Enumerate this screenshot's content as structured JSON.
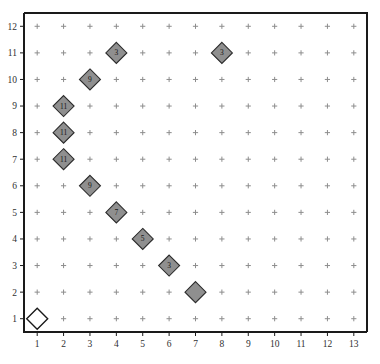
{
  "chart_data": {
    "type": "scatter",
    "title": "",
    "subtitle": "",
    "xlabel": "",
    "ylabel": "",
    "xlim": [
      1,
      13
    ],
    "ylim": [
      1,
      12
    ],
    "grid": true,
    "grid_marker": "+",
    "legend": "none",
    "x_ticks": [
      "1",
      "2",
      "3",
      "4",
      "5",
      "6",
      "7",
      "8",
      "9",
      "10",
      "11",
      "12",
      "13"
    ],
    "y_ticks": [
      "1",
      "2",
      "3",
      "4",
      "5",
      "6",
      "7",
      "8",
      "9",
      "10",
      "11",
      "12"
    ],
    "marker_shape": "diamond",
    "points": [
      {
        "x": 1,
        "y": 1,
        "label": "",
        "style": "open"
      },
      {
        "x": 2,
        "y": 9,
        "label": "11",
        "style": "filled"
      },
      {
        "x": 2,
        "y": 8,
        "label": "11",
        "style": "filled"
      },
      {
        "x": 2,
        "y": 7,
        "label": "11",
        "style": "filled"
      },
      {
        "x": 3,
        "y": 10,
        "label": "9",
        "style": "filled"
      },
      {
        "x": 3,
        "y": 6,
        "label": "9",
        "style": "filled"
      },
      {
        "x": 4,
        "y": 11,
        "label": "3",
        "style": "filled"
      },
      {
        "x": 4,
        "y": 5,
        "label": "7",
        "style": "filled"
      },
      {
        "x": 5,
        "y": 4,
        "label": "5",
        "style": "filled"
      },
      {
        "x": 6,
        "y": 3,
        "label": "3",
        "style": "filled"
      },
      {
        "x": 7,
        "y": 2,
        "label": "",
        "style": "filled"
      },
      {
        "x": 8,
        "y": 11,
        "label": "3",
        "style": "filled"
      }
    ],
    "colors": {
      "marker_fill": "#8f8f8f",
      "marker_stroke": "#2b2b2b",
      "open_marker_fill": "#ffffff",
      "grid_marker": "#8d8d8d",
      "axis": "#1a1a1a",
      "background": "#ffffff",
      "tick_text": "#303030"
    }
  }
}
